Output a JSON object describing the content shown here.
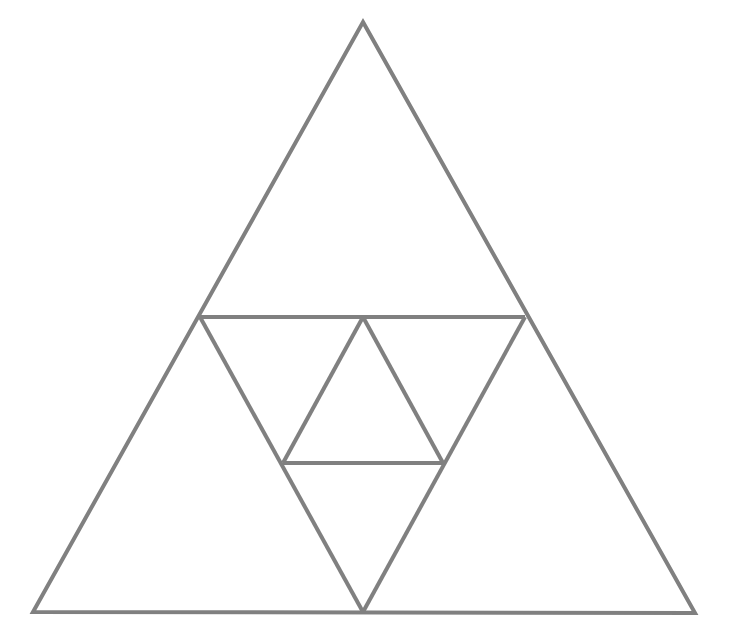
{
  "figure": {
    "background_color": "#ffffff",
    "stroke_color": "#808080",
    "stroke_width": 4,
    "canvas": {
      "width": 730,
      "height": 628
    }
  },
  "chart_data": {
    "type": "diagram",
    "xlabel": "",
    "ylabel": "",
    "xlim": [
      0,
      730
    ],
    "ylim": [
      0,
      628
    ],
    "grid": false,
    "legend": "none",
    "points": {
      "apex": [
        363,
        22
      ],
      "bottom_left": [
        33,
        612
      ],
      "bottom_right": [
        695,
        613
      ],
      "mid_left": [
        200,
        317
      ],
      "mid_right": [
        525,
        317
      ],
      "bottom_center": [
        363,
        612
      ],
      "inner_apex": [
        363,
        317
      ],
      "inner_left": [
        283,
        463
      ],
      "inner_right": [
        443,
        463
      ]
    },
    "shapes": [
      {
        "name": "outer-triangle",
        "kind": "polygon",
        "points": "363,22 695,613 33,612",
        "orientation": "up",
        "level": 0
      },
      {
        "name": "midline-chord",
        "kind": "line",
        "points": "200,317 525,317",
        "orientation": "horizontal",
        "level": 1
      },
      {
        "name": "medial-inverted-triangle-left-edge",
        "kind": "line",
        "points": "200,317 363,612",
        "orientation": "down",
        "level": 1
      },
      {
        "name": "medial-inverted-triangle-right-edge",
        "kind": "line",
        "points": "525,317 363,612",
        "orientation": "down",
        "level": 1
      },
      {
        "name": "inner-upward-triangle-left-edge",
        "kind": "line",
        "points": "363,317 283,463",
        "orientation": "up",
        "level": 2
      },
      {
        "name": "inner-upward-triangle-right-edge",
        "kind": "line",
        "points": "363,317 443,463",
        "orientation": "up",
        "level": 2
      },
      {
        "name": "inner-chord",
        "kind": "line",
        "points": "283,463 443,463",
        "orientation": "horizontal",
        "level": 2
      }
    ],
    "counts": {
      "total_line_segments": 9,
      "visible_triangles_level_0": 1,
      "visible_triangles_level_1": 2,
      "visible_triangles_level_2": 3
    },
    "labels": [],
    "annotations": []
  }
}
